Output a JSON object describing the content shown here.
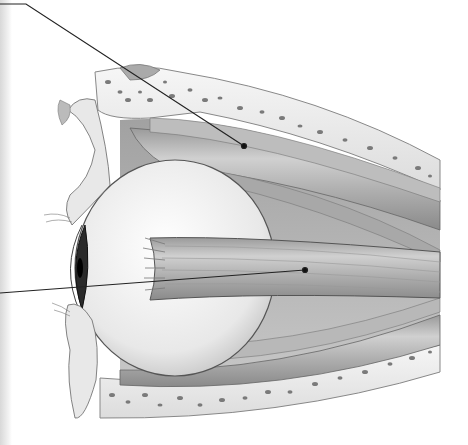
{
  "figure": {
    "colors": {
      "background": "#ffffff",
      "bone": "#ececec",
      "bone_pores": "#7a7a7a",
      "muscle_light": "#c8c8c8",
      "muscle_dark": "#8a8a8a",
      "globe": "#f0f0f0",
      "leader_line": "#222222"
    },
    "leader_lines": [
      {
        "id": "upper",
        "from": [
          0,
          4
        ],
        "bend": [
          26,
          4
        ],
        "to": [
          244,
          146
        ]
      },
      {
        "id": "lower",
        "from": [
          0,
          293
        ],
        "to": [
          305,
          270
        ]
      }
    ]
  }
}
